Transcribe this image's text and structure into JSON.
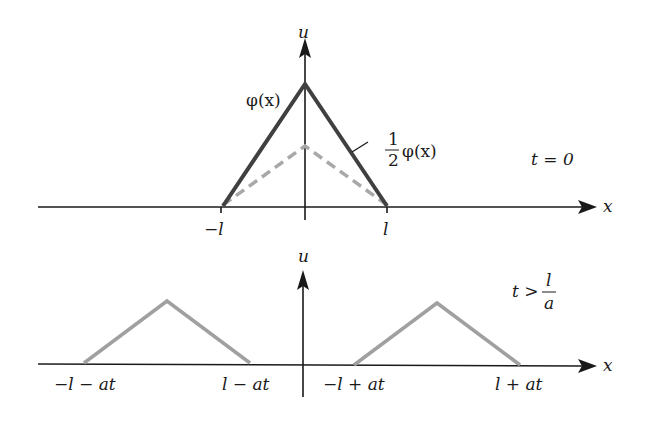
{
  "figure": {
    "top_panel": {
      "axis_x_label": "x",
      "axis_u_label": "u",
      "curve_full_label": "φ(x)",
      "curve_half_label_num": "1",
      "curve_half_label_den": "2",
      "curve_half_label_func": "φ(x)",
      "time_label": "t = 0",
      "tick_left": "−l",
      "tick_right": "l"
    },
    "bottom_panel": {
      "axis_x_label": "x",
      "axis_u_label": "u",
      "time_label_prefix": "t >",
      "time_label_num": "l",
      "time_label_den": "a",
      "tick_1": "−l − at",
      "tick_2": "l − at",
      "tick_3": "−l + at",
      "tick_4": "l + at"
    },
    "colors": {
      "axis": "#1a1a1a",
      "full_curve": "#404040",
      "half_curve": "#a8a8a8",
      "wave": "#a0a0a0"
    }
  }
}
